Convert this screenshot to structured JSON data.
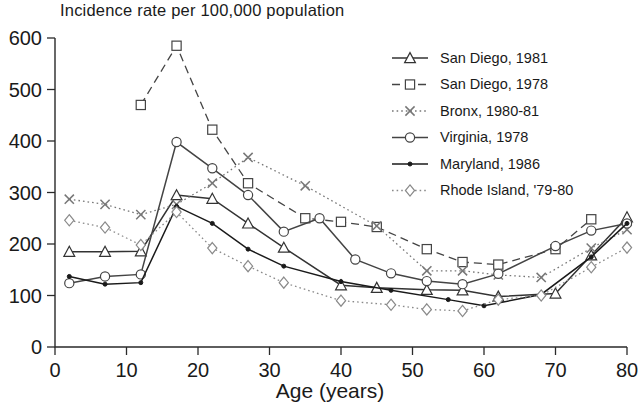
{
  "chart_data": {
    "type": "line",
    "title": "Incidence rate per 100,000 population",
    "xlabel": "Age (years)",
    "ylabel": "",
    "xlim": [
      0,
      80
    ],
    "ylim": [
      0,
      600
    ],
    "xticks": [
      0,
      10,
      20,
      30,
      40,
      50,
      60,
      70,
      80
    ],
    "yticks": [
      0,
      100,
      200,
      300,
      400,
      500,
      600
    ],
    "grid": false,
    "legend_position": "top-right",
    "series": [
      {
        "name": "San Diego, 1981",
        "marker": "triangle",
        "line_style": "solid",
        "color": "#333333",
        "x": [
          2,
          7,
          12,
          17,
          22,
          27,
          32,
          40,
          45,
          52,
          57,
          62,
          70,
          75,
          80
        ],
        "y": [
          185,
          185,
          186,
          295,
          288,
          240,
          193,
          120,
          115,
          111,
          110,
          98,
          104,
          178,
          252
        ]
      },
      {
        "name": "San Diego, 1978",
        "marker": "square",
        "line_style": "dashed",
        "color": "#444444",
        "x": [
          12,
          17,
          22,
          27,
          35,
          40,
          45,
          52,
          57,
          62,
          70,
          75
        ],
        "y": [
          470,
          585,
          422,
          318,
          250,
          243,
          233,
          190,
          165,
          160,
          190,
          248
        ]
      },
      {
        "name": "Bronx, 1980-81",
        "marker": "cross",
        "line_style": "dotted",
        "color": "#777777",
        "x": [
          2,
          7,
          12,
          17,
          22,
          27,
          35,
          45,
          52,
          57,
          62,
          68,
          75,
          80
        ],
        "y": [
          287,
          277,
          257,
          277,
          318,
          368,
          313,
          235,
          148,
          148,
          140,
          135,
          192,
          228
        ]
      },
      {
        "name": "Virginia, 1978",
        "marker": "circle",
        "line_style": "solid",
        "color": "#444444",
        "x": [
          2,
          7,
          12,
          17,
          22,
          27,
          32,
          37,
          42,
          47,
          52,
          57,
          62,
          70,
          75,
          80
        ],
        "y": [
          124,
          137,
          141,
          398,
          347,
          295,
          224,
          250,
          170,
          143,
          128,
          122,
          142,
          196,
          226,
          240
        ]
      },
      {
        "name": "Maryland, 1986",
        "marker": "dot",
        "line_style": "solid",
        "color": "#1a1a1a",
        "x": [
          2,
          7,
          12,
          17,
          22,
          27,
          32,
          40,
          47,
          55,
          60,
          68,
          75,
          80
        ],
        "y": [
          137,
          122,
          125,
          273,
          240,
          190,
          157,
          127,
          110,
          92,
          80,
          102,
          175,
          240
        ]
      },
      {
        "name": "Rhode Island, '79-80",
        "marker": "diamond",
        "line_style": "dotted",
        "color": "#8a8a8a",
        "x": [
          2,
          7,
          12,
          17,
          22,
          27,
          32,
          40,
          47,
          52,
          57,
          62,
          68,
          75,
          80
        ],
        "y": [
          246,
          232,
          198,
          262,
          192,
          157,
          125,
          90,
          82,
          73,
          70,
          92,
          100,
          155,
          193
        ]
      }
    ]
  },
  "axes": {
    "x_title": "Age (years)",
    "title": "Incidence rate per 100,000 population"
  }
}
